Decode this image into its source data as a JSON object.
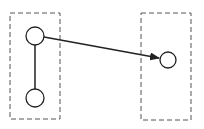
{
  "diagram": {
    "width": 204,
    "height": 129,
    "background": "#ffffff",
    "stroke_color": "#222222",
    "groups": [
      {
        "id": "left-group",
        "x": 10,
        "y": 13,
        "width": 50,
        "height": 106,
        "style": "dashed"
      },
      {
        "id": "right-group",
        "x": 141,
        "y": 13,
        "width": 50,
        "height": 107,
        "style": "dashed"
      }
    ],
    "nodes": [
      {
        "id": "left-top-node",
        "cx": 35,
        "cy": 36,
        "r": 9
      },
      {
        "id": "left-bottom-node",
        "cx": 35,
        "cy": 98,
        "r": 9
      },
      {
        "id": "right-node",
        "cx": 168,
        "cy": 60,
        "r": 8
      }
    ],
    "edges": [
      {
        "from": "left-top-node",
        "to": "left-bottom-node",
        "directed": false
      },
      {
        "from": "left-top-node",
        "to": "right-node",
        "directed": true
      }
    ]
  }
}
